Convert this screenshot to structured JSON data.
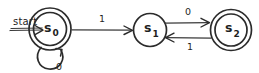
{
  "diagram": {
    "kind": "finite-state-machine",
    "start_marker": {
      "label": "start",
      "underlined": true,
      "points_to": "s0"
    },
    "states": [
      {
        "id": "s0",
        "name": "s",
        "subscript": "0",
        "display": "s0",
        "accepting": true,
        "shape": "double-circle",
        "cx": 50,
        "cy": 29,
        "r_outer": 21,
        "r_inner": 17
      },
      {
        "id": "s1",
        "name": "s",
        "subscript": "1",
        "display": "s1",
        "accepting": false,
        "shape": "circle",
        "cx": 150,
        "cy": 30,
        "r_outer": 17,
        "r_inner": 17
      },
      {
        "id": "s2",
        "name": "s",
        "subscript": "2",
        "display": "s2",
        "accepting": true,
        "shape": "double-circle",
        "cx": 231,
        "cy": 30,
        "r_outer": 21,
        "r_inner": 17
      }
    ],
    "transitions": [
      {
        "id": "t-s0-s1",
        "from": "s0",
        "to": "s1",
        "label": "1",
        "kind": "straight",
        "direction": "right",
        "label_x": 102,
        "label_y": 21
      },
      {
        "id": "t-s1-s2",
        "from": "s1",
        "to": "s2",
        "label": "0",
        "kind": "straight",
        "direction": "right",
        "label_x": 188,
        "label_y": 14
      },
      {
        "id": "t-s2-s1",
        "from": "s2",
        "to": "s1",
        "label": "1",
        "kind": "straight",
        "direction": "left",
        "label_x": 190,
        "label_y": 50
      },
      {
        "id": "t-s0-s0",
        "from": "s0",
        "to": "s0",
        "label": "0",
        "kind": "self-loop",
        "direction": "below",
        "label_x": 60,
        "label_y": 70
      }
    ],
    "colors": {
      "ink": "#2b2b2b",
      "background": "#ffffff",
      "text": "#1f1f1f"
    }
  }
}
